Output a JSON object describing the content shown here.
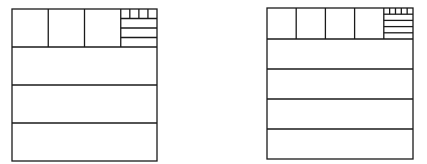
{
  "diagram": {
    "stroke_color": "#1a1a1a",
    "background": "#ffffff",
    "figures": [
      {
        "id": "left",
        "n": 4,
        "box": {
          "x": 12,
          "y": 9,
          "w": 145,
          "h": 152
        },
        "top_row_height": 38,
        "top_row_cells": 4,
        "lower_strips": 3,
        "subdivided_cell": {
          "small_squares": 4,
          "strips": 3
        }
      },
      {
        "id": "right",
        "n": 5,
        "box": {
          "x": 267,
          "y": 8,
          "w": 146,
          "h": 151
        },
        "top_row_height": 31,
        "top_row_cells": 5,
        "lower_strips": 4,
        "subdivided_cell": {
          "small_squares": 5,
          "strips": 4
        }
      }
    ]
  }
}
